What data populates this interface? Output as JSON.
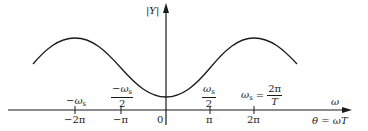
{
  "diagram": {
    "y_axis": {
      "label": "|Y|"
    },
    "x_axis": {
      "label_top": "ω",
      "label_bottom": "θ = ωT"
    },
    "ticks_bottom": [
      {
        "id": "neg-2pi",
        "label": "−2π"
      },
      {
        "id": "neg-pi",
        "label": "−π"
      },
      {
        "id": "zero",
        "label": "0"
      },
      {
        "id": "pi",
        "label": "π"
      },
      {
        "id": "2pi",
        "label": "2π"
      }
    ],
    "ticks_top": {
      "neg_ws": "−ω",
      "neg_ws_half_num": "−ω",
      "neg_ws_half_den": "2",
      "ws_half_num": "ω",
      "ws_half_den": "2",
      "ws_def_lhs": "ω",
      "ws_def_eq": "=",
      "ws_def_num": "2π",
      "ws_def_den": "T",
      "sub": "s"
    },
    "curve": {
      "description": "periodic cosine-like magnitude, minimum at 0, maxima at ±2π",
      "color": "#1a1a1a"
    }
  }
}
